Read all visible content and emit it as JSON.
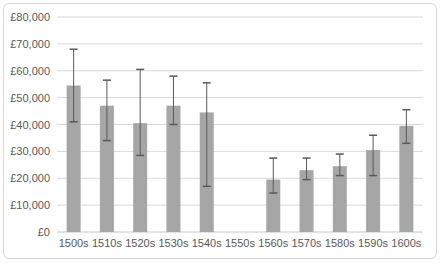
{
  "chart_data": {
    "type": "bar",
    "title": "",
    "xlabel": "",
    "ylabel": "",
    "categories": [
      "1500s",
      "1510s",
      "1520s",
      "1530s",
      "1540s",
      "1550s",
      "1560s",
      "1570s",
      "1580s",
      "1590s",
      "1600s"
    ],
    "values": [
      54500,
      47000,
      40500,
      47000,
      44500,
      null,
      19500,
      23000,
      24500,
      30500,
      39500
    ],
    "error_bars": [
      {
        "upper": 68000,
        "lower": 41000
      },
      {
        "upper": 56500,
        "lower": 34000
      },
      {
        "upper": 60500,
        "lower": 28500
      },
      {
        "upper": 58000,
        "lower": 40000
      },
      {
        "upper": 55500,
        "lower": 17000
      },
      null,
      {
        "upper": 27500,
        "lower": 14500
      },
      {
        "upper": 27500,
        "lower": 19500
      },
      {
        "upper": 29000,
        "lower": 21000
      },
      {
        "upper": 36000,
        "lower": 21000
      },
      {
        "upper": 45500,
        "lower": 33000
      }
    ],
    "ylim": [
      0,
      80000
    ],
    "ytick_step": 10000,
    "ytick_prefix": "£",
    "ytick_labels": [
      "£0",
      "£10,000",
      "£20,000",
      "£30,000",
      "£40,000",
      "£50,000",
      "£60,000",
      "£70,000",
      "£80,000"
    ],
    "grid": true,
    "legend": false,
    "colors": {
      "bar": "#a6a6a6",
      "error": "#595959",
      "grid": "#d9d9d9",
      "zero_axis": "#c6c6c6",
      "text": "#595959",
      "background": "#ffffff",
      "frame_border": "#d7d7d7"
    }
  }
}
